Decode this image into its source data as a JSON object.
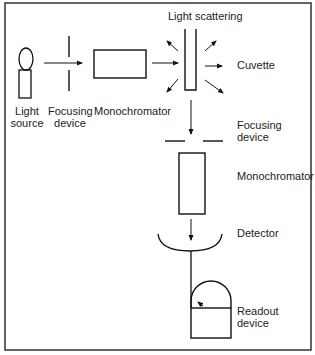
{
  "diagram": {
    "labels": {
      "light_source": [
        "Light",
        "source"
      ],
      "focusing_device_1": [
        "Focusing",
        "device"
      ],
      "monochromator_1": "Monochromator",
      "light_scattering": "Light scattering",
      "cuvette": "Cuvette",
      "focusing_device_2": [
        "Focusing",
        "device"
      ],
      "monochromator_2": "Monochromator",
      "detector": "Detector",
      "readout_device": [
        "Readout",
        "device"
      ]
    },
    "colors": {
      "stroke": "#111111",
      "background": "#ffffff",
      "frame": "#333333"
    },
    "components": [
      {
        "id": "light-source",
        "shape": "bulb"
      },
      {
        "id": "focusing-device-1",
        "shape": "slit-vertical"
      },
      {
        "id": "monochromator-1",
        "shape": "rect-horizontal"
      },
      {
        "id": "cuvette",
        "shape": "u-tube"
      },
      {
        "id": "focusing-device-2",
        "shape": "slit-horizontal"
      },
      {
        "id": "monochromator-2",
        "shape": "rect-vertical"
      },
      {
        "id": "detector",
        "shape": "arc"
      },
      {
        "id": "readout-device",
        "shape": "meter"
      }
    ]
  }
}
